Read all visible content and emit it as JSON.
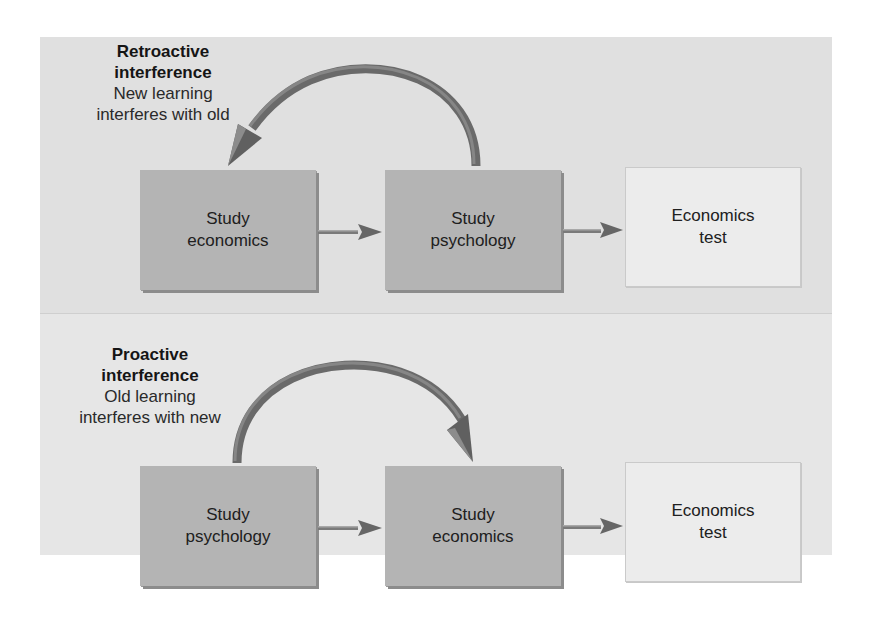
{
  "cutoff_caption": "",
  "retroactive": {
    "title_line1": "Retroactive",
    "title_line2": "interference",
    "desc_line1": "New learning",
    "desc_line2": "interferes with old",
    "boxes": [
      {
        "line1": "Study",
        "line2": "economics",
        "style": "dark"
      },
      {
        "line1": "Study",
        "line2": "psychology",
        "style": "dark"
      },
      {
        "line1": "Economics",
        "line2": "test",
        "style": "light"
      }
    ],
    "curved_arrow_direction": "from box 2 back to box 1"
  },
  "proactive": {
    "title_line1": "Proactive",
    "title_line2": "interference",
    "desc_line1": "Old learning",
    "desc_line2": "interferes with new",
    "boxes": [
      {
        "line1": "Study",
        "line2": "psychology",
        "style": "dark"
      },
      {
        "line1": "Study",
        "line2": "economics",
        "style": "dark"
      },
      {
        "line1": "Economics",
        "line2": "test",
        "style": "light"
      }
    ],
    "curved_arrow_direction": "from box 1 forward to box 2"
  },
  "colors": {
    "panel_top": "#e0e0e0",
    "panel_bottom": "#e6e6e6",
    "box_dark": "#b4b4b4",
    "box_light": "#ececec",
    "arrow": "#6e6e6e"
  }
}
